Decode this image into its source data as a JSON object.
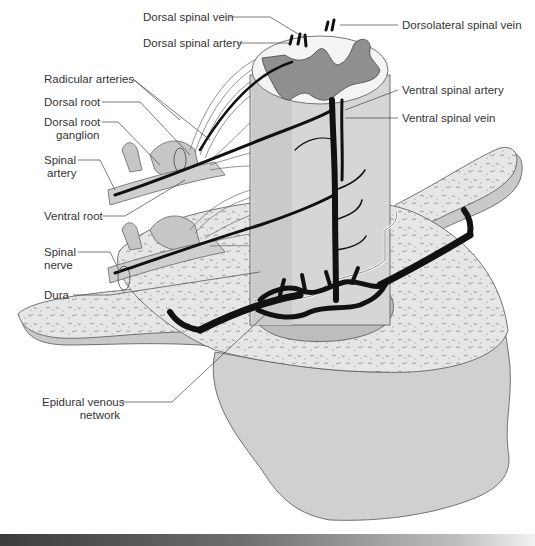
{
  "figure": {
    "type": "anatomical illustration",
    "colors": {
      "bone": "#e4e4e4",
      "bone_side": "#c9c9c9",
      "gray_matter": "#8f8f8f",
      "white_matter": "#f4f4f4",
      "vessel": "#111111",
      "nerve": "#bdbdbd",
      "dura": "#d6d6d6",
      "caption_bar": "#3c3c3c"
    }
  },
  "labels": {
    "dorsal_spinal_vein": "Dorsal spinal vein",
    "dorsal_spinal_artery": "Dorsal spinal artery",
    "dorsolateral_spinal_vein": "Dorsolateral spinal vein",
    "radicular_arteries": "Radicular arteries",
    "dorsal_root": "Dorsal root",
    "dorsal_root_ganglion_1": "Dorsal root",
    "dorsal_root_ganglion_2": "ganglion",
    "spinal_artery_1": "Spinal",
    "spinal_artery_2": "artery",
    "ventral_spinal_artery": "Ventral spinal artery",
    "ventral_spinal_vein": "Ventral spinal vein",
    "ventral_root": "Ventral root",
    "spinal_nerve_1": "Spinal",
    "spinal_nerve_2": "nerve",
    "dura": "Dura",
    "epidural_venous_network_1": "Epidural venous",
    "epidural_venous_network_2": "network"
  },
  "caption": {
    "visible": true,
    "text_legible": false
  }
}
